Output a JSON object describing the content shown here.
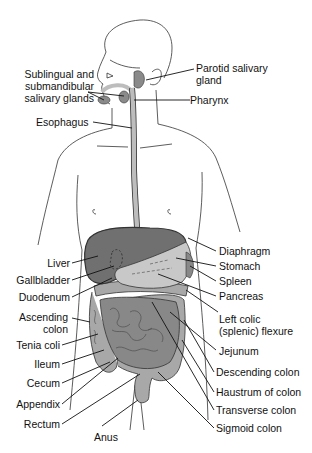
{
  "figure": {
    "colors": {
      "liver": "#707070",
      "stomach": "#c8c8c8",
      "intestine_small": "#888888",
      "intestine_large": "#a8a8a8",
      "esophagus": "#bdbdbd",
      "glands": "#8a8a8a",
      "outline": "#333333",
      "background": "#ffffff"
    }
  },
  "labels": {
    "left": [
      {
        "id": "sublingual",
        "text": "Sublingual and submandibular salivary glands",
        "lines": [
          "Sublingual and",
          "submandibular",
          "salivary glands"
        ]
      },
      {
        "id": "esophagus",
        "text": "Esophagus"
      },
      {
        "id": "liver",
        "text": "Liver"
      },
      {
        "id": "gallbladder",
        "text": "Gallbladder"
      },
      {
        "id": "duodenum",
        "text": "Duodenum"
      },
      {
        "id": "ascending-colon",
        "text": "Ascending colon",
        "lines": [
          "Ascending",
          "colon"
        ]
      },
      {
        "id": "tenia-coli",
        "text": "Tenia coli"
      },
      {
        "id": "ileum",
        "text": "Ileum"
      },
      {
        "id": "cecum",
        "text": "Cecum"
      },
      {
        "id": "appendix",
        "text": "Appendix"
      },
      {
        "id": "rectum",
        "text": "Rectum"
      },
      {
        "id": "anus",
        "text": "Anus"
      }
    ],
    "right": [
      {
        "id": "parotid",
        "text": "Parotid salivary gland",
        "lines": [
          "Parotid salivary",
          "gland"
        ]
      },
      {
        "id": "pharynx",
        "text": "Pharynx"
      },
      {
        "id": "diaphragm",
        "text": "Diaphragm"
      },
      {
        "id": "stomach",
        "text": "Stomach"
      },
      {
        "id": "spleen",
        "text": "Spleen"
      },
      {
        "id": "pancreas",
        "text": "Pancreas"
      },
      {
        "id": "left-colic",
        "text": "Left colic (splenic) flexure",
        "lines": [
          "Left colic",
          "(splenic) flexure"
        ]
      },
      {
        "id": "jejunum",
        "text": "Jejunum"
      },
      {
        "id": "descending-colon",
        "text": "Descending colon"
      },
      {
        "id": "haustrum",
        "text": "Haustrum of colon"
      },
      {
        "id": "transverse-colon",
        "text": "Transverse colon"
      },
      {
        "id": "sigmoid-colon",
        "text": "Sigmoid colon"
      }
    ]
  }
}
